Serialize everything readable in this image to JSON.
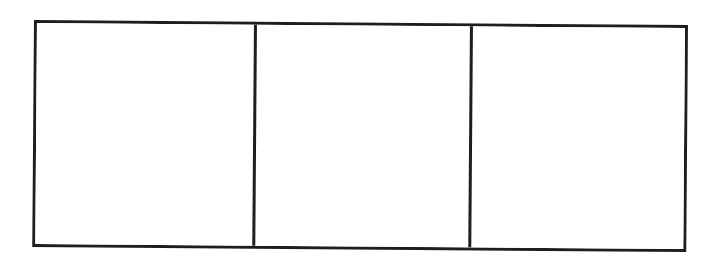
{
  "comic_strip": {
    "panel_count": 3,
    "border_color": "#1e1e1e",
    "background_color": "#ffffff",
    "panels": [
      {
        "index": 1,
        "content": ""
      },
      {
        "index": 2,
        "content": ""
      },
      {
        "index": 3,
        "content": ""
      }
    ]
  }
}
